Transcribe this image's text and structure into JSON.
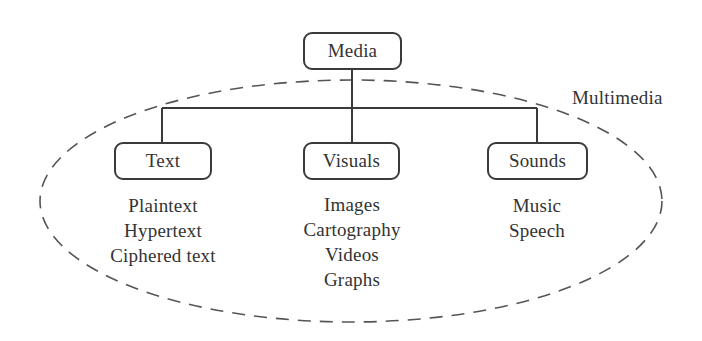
{
  "diagram": {
    "type": "hierarchy",
    "root": {
      "label": "Media"
    },
    "group": {
      "label": "Multimedia",
      "shape": "dashed-ellipse"
    },
    "children": [
      {
        "label": "Text",
        "items": [
          "Plaintext",
          "Hypertext",
          "Ciphered text"
        ]
      },
      {
        "label": "Visuals",
        "items": [
          "Images",
          "Cartography",
          "Videos",
          "Graphs"
        ]
      },
      {
        "label": "Sounds",
        "items": [
          "Music",
          "Speech"
        ]
      }
    ],
    "colors": {
      "line": "#3a3a3a",
      "dashed": "#555555",
      "text": "#333333",
      "background": "#ffffff"
    }
  }
}
